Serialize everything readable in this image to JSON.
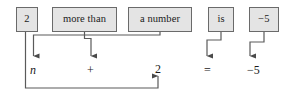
{
  "diagram": {
    "type": "translation-diagram",
    "colors": {
      "box_fill": "#e4e4e4",
      "box_border": "#6a6a6a",
      "connector": "#555555",
      "text": "#1a1a1a",
      "background": "#ffffff"
    },
    "phrase_boxes": [
      {
        "id": "two",
        "label": "2",
        "x": 16,
        "y": 7,
        "w": 22,
        "h": 25
      },
      {
        "id": "more-than",
        "label": "more than",
        "x": 52,
        "y": 7,
        "w": 65,
        "h": 25
      },
      {
        "id": "a-number",
        "label": "a number",
        "x": 128,
        "y": 7,
        "w": 64,
        "h": 25
      },
      {
        "id": "is",
        "label": "is",
        "x": 208,
        "y": 7,
        "w": 26,
        "h": 25
      },
      {
        "id": "negative-five",
        "label": "−5",
        "x": 249,
        "y": 7,
        "w": 30,
        "h": 25
      }
    ],
    "equation_terms": [
      {
        "id": "variable-n",
        "label": "n",
        "italic": true,
        "x": 30,
        "y": 64
      },
      {
        "id": "plus-operator",
        "label": "+",
        "italic": false,
        "x": 87,
        "y": 64
      },
      {
        "id": "constant-2",
        "label": "2",
        "italic": false,
        "x": 155,
        "y": 63
      },
      {
        "id": "equals-operator",
        "label": "=",
        "italic": false,
        "x": 204,
        "y": 64
      },
      {
        "id": "result-negative-five",
        "label": "−5",
        "italic": false,
        "x": 247,
        "y": 64
      }
    ],
    "equation_text": "n + 2 = −5",
    "connectors": [
      {
        "id": "two-to-constant",
        "from": "two",
        "to": "constant-2",
        "path": "M 25.5 32 L 25.5 88 L 158 88 L 158 76"
      },
      {
        "id": "more-than-to-plus",
        "from": "more-than",
        "to": "plus-operator",
        "path": "M 84.5 32 L 84.5 38.5 L 91 38.5 L 91 56"
      },
      {
        "id": "a-number-to-n",
        "from": "a-number",
        "to": "variable-n",
        "path": "M 160 32 L 160 35 L 33.5 35 L 33.5 56"
      },
      {
        "id": "is-to-equals",
        "from": "is",
        "to": "equals-operator",
        "path": "M 221 32 L 221 40 L 207 40 L 207 56"
      },
      {
        "id": "negative-five-to-result",
        "from": "negative-five",
        "to": "result-negative-five",
        "path": "M 264 32 L 264 42 L 250 42 L 250 56"
      }
    ]
  }
}
